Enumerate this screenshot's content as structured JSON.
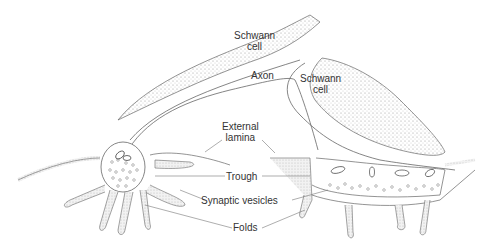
{
  "diagram": {
    "labels": {
      "schwann_cell_upper": "Schwann\ncell",
      "schwann_cell_upper_line1": "Schwann",
      "schwann_cell_upper_line2": "cell",
      "schwann_cell_right_line1": "Schwann",
      "schwann_cell_right_line2": "cell",
      "axon": "Axon",
      "external_lamina_line1": "External",
      "external_lamina_line2": "lamina",
      "trough": "Trough",
      "synaptic_vesicles": "Synaptic vesicles",
      "folds": "Folds"
    },
    "colors": {
      "line": "#555555",
      "stipple": "#9a9a9a",
      "text": "#333333",
      "background": "#ffffff"
    }
  }
}
